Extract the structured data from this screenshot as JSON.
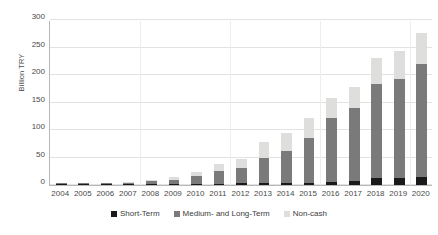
{
  "chart_data": {
    "type": "bar",
    "stacked": true,
    "title": "",
    "subtitle": "",
    "xlabel": "",
    "ylabel": "Billion TRY",
    "ylim": [
      0,
      300
    ],
    "ytick_labels": [
      "0",
      "50",
      "100",
      "150",
      "200",
      "250",
      "300"
    ],
    "ytick_values": [
      0,
      50,
      100,
      150,
      200,
      250,
      300
    ],
    "grid": true,
    "legend_position": "bottom",
    "categories": [
      "2004",
      "2005",
      "2006",
      "2007",
      "2008",
      "2009",
      "2010",
      "2011",
      "2012",
      "2013",
      "2014",
      "2015",
      "2016",
      "2017",
      "2018",
      "2019",
      "2020"
    ],
    "series": [
      {
        "name": "Short-Term",
        "color": "#1a1a1a",
        "values": [
          0.2,
          0.3,
          0.5,
          0.8,
          1.2,
          1.5,
          2.0,
          2.5,
          3.0,
          3.5,
          4.0,
          4.5,
          6.0,
          8.0,
          13.0,
          12.5,
          15.0
        ]
      },
      {
        "name": "Medium- and Long-Term",
        "color": "#7a7a7a",
        "values": [
          0.6,
          0.9,
          1.6,
          2.7,
          5.3,
          8.5,
          13.5,
          23.0,
          28.0,
          46.0,
          57.5,
          81.0,
          115.0,
          131.5,
          170.0,
          181.0,
          205.0
        ]
      },
      {
        "name": "Non-cash",
        "color": "#dededc",
        "values": [
          0.4,
          0.6,
          0.9,
          1.3,
          2.0,
          4.5,
          9.0,
          13.0,
          16.0,
          28.5,
          33.0,
          36.5,
          37.0,
          39.5,
          48.0,
          51.0,
          56.0
        ]
      }
    ],
    "totals": [
      1.2,
      1.8,
      3.0,
      4.8,
      8.5,
      14.5,
      24.5,
      38.5,
      47.0,
      78.0,
      94.5,
      122.0,
      158.0,
      179.0,
      231.0,
      244.5,
      276.0
    ]
  }
}
